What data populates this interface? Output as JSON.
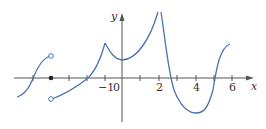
{
  "graph": {
    "x_axis_label": "x",
    "y_axis_label": "y",
    "tick_labels": {
      "neg1": "−1",
      "zero": "0",
      "two": "2",
      "four": "4",
      "six": "6"
    },
    "curve_color": "#4a72b0",
    "axis_color": "#555555"
  }
}
